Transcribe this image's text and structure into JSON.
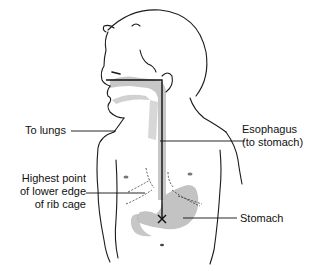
{
  "diagram": {
    "labels": {
      "to_lungs": "To lungs",
      "esophagus_line1": "Esophagus",
      "esophagus_line2": "(to stomach)",
      "rib_line1": "Highest point",
      "rib_line2": "of lower edge",
      "rib_line3": "of rib cage",
      "stomach": "Stomach"
    },
    "colors": {
      "outline": "#1a1a1a",
      "shading": "#b8b8b8",
      "measure_line": "#111111"
    }
  }
}
